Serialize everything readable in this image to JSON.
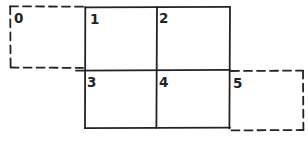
{
  "diagram": {
    "background": "#ffffff",
    "ink_color": "#232323",
    "cells": [
      {
        "label": "0",
        "border": "dashed",
        "position": "ghost-left-of-top-row"
      },
      {
        "label": "1",
        "border": "solid",
        "position": "row1-col1"
      },
      {
        "label": "2",
        "border": "solid",
        "position": "row1-col2"
      },
      {
        "label": "3",
        "border": "solid",
        "position": "row2-col1"
      },
      {
        "label": "4",
        "border": "solid",
        "position": "row2-col2"
      },
      {
        "label": "5",
        "border": "dashed",
        "position": "ghost-right-of-bottom-row"
      }
    ]
  }
}
